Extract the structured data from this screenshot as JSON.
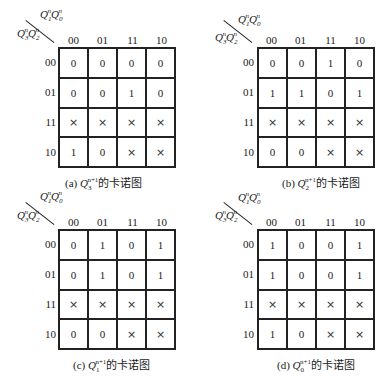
{
  "col_headers": [
    "00",
    "01",
    "11",
    "10"
  ],
  "row_headers": [
    "00",
    "01",
    "11",
    "10"
  ],
  "col_var_label": "Q1nQ0n",
  "row_var_label": "Q3nQ2n",
  "dont_care_symbol": "×",
  "maps": [
    {
      "id": "a",
      "caption_prefix": "(a) ",
      "caption_var": "Q",
      "caption_sub": "3",
      "caption_sup": "n+1",
      "caption_suffix": "的卡诺图",
      "cells": [
        [
          "0",
          "0",
          "0",
          "0"
        ],
        [
          "0",
          "0",
          "1",
          "0"
        ],
        [
          "×",
          "×",
          "×",
          "×"
        ],
        [
          "1",
          "0",
          "×",
          "×"
        ]
      ]
    },
    {
      "id": "b",
      "caption_prefix": "(b) ",
      "caption_var": "Q",
      "caption_sub": "2",
      "caption_sup": "n+1",
      "caption_suffix": "的卡诺图",
      "cells": [
        [
          "0",
          "0",
          "1",
          "0"
        ],
        [
          "1",
          "1",
          "0",
          "1"
        ],
        [
          "×",
          "×",
          "×",
          "×"
        ],
        [
          "0",
          "0",
          "×",
          "×"
        ]
      ]
    },
    {
      "id": "c",
      "caption_prefix": "(c) ",
      "caption_var": "Q",
      "caption_sub": "1",
      "caption_sup": "n+1",
      "caption_suffix": "的卡诺图",
      "cells": [
        [
          "0",
          "1",
          "0",
          "1"
        ],
        [
          "0",
          "1",
          "0",
          "1"
        ],
        [
          "×",
          "×",
          "×",
          "×"
        ],
        [
          "0",
          "0",
          "×",
          "×"
        ]
      ]
    },
    {
      "id": "d",
      "caption_prefix": "(d) ",
      "caption_var": "Q",
      "caption_sub": "0",
      "caption_sup": "n+1",
      "caption_suffix": "的卡诺图",
      "cells": [
        [
          "1",
          "0",
          "0",
          "1"
        ],
        [
          "1",
          "0",
          "0",
          "1"
        ],
        [
          "×",
          "×",
          "×",
          "×"
        ],
        [
          "1",
          "0",
          "×",
          "×"
        ]
      ]
    }
  ],
  "labels": {
    "col_var": {
      "q1": "Q",
      "s1": "1",
      "p1": "n",
      "q2": "Q",
      "s2": "0",
      "p2": "n"
    },
    "row_var": {
      "q1": "Q",
      "s1": "3",
      "p1": "n",
      "q2": "Q",
      "s2": "2",
      "p2": "n"
    }
  }
}
